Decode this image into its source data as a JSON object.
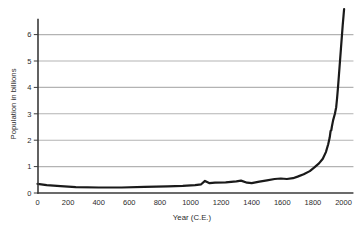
{
  "figure": {
    "background": "#ffffff"
  },
  "chart_data": {
    "type": "line",
    "title": "",
    "xlabel": "Year (C.E.)",
    "ylabel": "Population in billions",
    "x_ticks": [
      0,
      200,
      400,
      600,
      800,
      1000,
      1200,
      1400,
      1600,
      1800,
      2000
    ],
    "y_ticks": [
      0,
      1,
      2,
      3,
      4,
      5,
      6
    ],
    "xlim": [
      0,
      2065
    ],
    "ylim": [
      0,
      6.6
    ],
    "grid": "horizontal",
    "legend": "none",
    "colors": {
      "line": "#1a1a1a",
      "grid": "#b3b3b3",
      "axis": "#3a3a3a",
      "text": "#2b2b2b"
    },
    "series": [
      {
        "name": "World population (billions)",
        "points": [
          [
            0,
            0.35
          ],
          [
            60,
            0.3
          ],
          [
            150,
            0.26
          ],
          [
            250,
            0.22
          ],
          [
            400,
            0.21
          ],
          [
            550,
            0.21
          ],
          [
            700,
            0.23
          ],
          [
            850,
            0.25
          ],
          [
            950,
            0.27
          ],
          [
            1030,
            0.3
          ],
          [
            1070,
            0.33
          ],
          [
            1095,
            0.46
          ],
          [
            1125,
            0.37
          ],
          [
            1160,
            0.39
          ],
          [
            1230,
            0.4
          ],
          [
            1300,
            0.44
          ],
          [
            1330,
            0.47
          ],
          [
            1370,
            0.39
          ],
          [
            1400,
            0.37
          ],
          [
            1450,
            0.43
          ],
          [
            1500,
            0.48
          ],
          [
            1550,
            0.53
          ],
          [
            1590,
            0.55
          ],
          [
            1630,
            0.53
          ],
          [
            1670,
            0.56
          ],
          [
            1700,
            0.62
          ],
          [
            1740,
            0.71
          ],
          [
            1780,
            0.83
          ],
          [
            1810,
            0.97
          ],
          [
            1840,
            1.12
          ],
          [
            1865,
            1.3
          ],
          [
            1885,
            1.55
          ],
          [
            1900,
            1.85
          ],
          [
            1910,
            2.1
          ],
          [
            1916,
            2.35
          ],
          [
            1920,
            2.38
          ],
          [
            1924,
            2.52
          ],
          [
            1932,
            2.75
          ],
          [
            1944,
            3.0
          ],
          [
            1952,
            3.25
          ],
          [
            1958,
            3.6
          ],
          [
            1964,
            4.0
          ],
          [
            1970,
            4.45
          ],
          [
            1977,
            5.0
          ],
          [
            1983,
            5.45
          ],
          [
            1990,
            6.0
          ],
          [
            1995,
            6.35
          ],
          [
            2000,
            6.7
          ],
          [
            2004,
            6.97
          ]
        ]
      }
    ]
  }
}
